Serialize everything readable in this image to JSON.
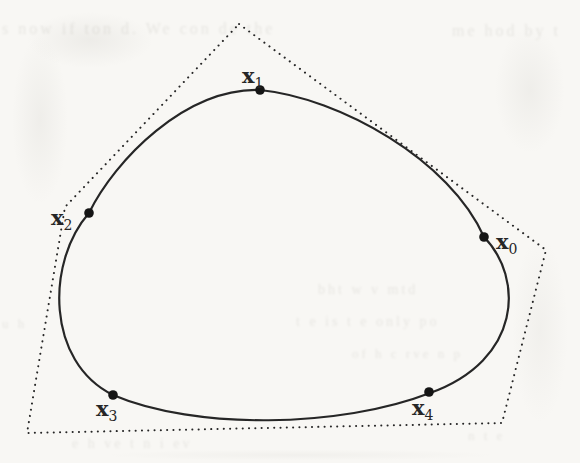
{
  "colors": {
    "paper": "#f8f7f4",
    "ink": "#262626",
    "dot": "#151515",
    "bleed": "#7d7a6f"
  },
  "figure": {
    "curve_path": "M 260 90 C 340 98 450 160 484 237 C 524 278 522 360 430 393 C 340 428 195 430 113 395 C 46 362 46 262 89 213 C 115 160 185 88 260 90 Z",
    "polygon_points": "239,24 546,250 502,423 27,433 65,207",
    "points": [
      {
        "id": "x0",
        "base": "x",
        "sub": "0",
        "dot": [
          484,
          237
        ],
        "label": [
          496,
          249
        ]
      },
      {
        "id": "x1",
        "base": "x",
        "sub": "1",
        "dot": [
          260,
          90
        ],
        "label": [
          242,
          83
        ]
      },
      {
        "id": "x2",
        "base": "x",
        "sub": "2",
        "dot": [
          89,
          213
        ],
        "label": [
          51,
          225
        ]
      },
      {
        "id": "x3",
        "base": "x",
        "sub": "3",
        "dot": [
          113,
          395
        ],
        "label": [
          96,
          416
        ]
      },
      {
        "id": "x4",
        "base": "x",
        "sub": "4",
        "dot": [
          429,
          392
        ],
        "label": [
          412,
          415
        ]
      }
    ]
  },
  "artifacts": [
    {
      "text": "s now if  ton d. We  con de  the",
      "x": 2,
      "y": 20,
      "size": 16
    },
    {
      "text": "me hod by t",
      "x": 452,
      "y": 22,
      "size": 16
    },
    {
      "text": "bht  w   v   mtd",
      "x": 318,
      "y": 282,
      "size": 14
    },
    {
      "text": "t e  is   t e  only  po",
      "x": 296,
      "y": 314,
      "size": 14
    },
    {
      "text": "of  h  c rve  n  p",
      "x": 352,
      "y": 346,
      "size": 13
    },
    {
      "text": "e  h ve   t   n i ev",
      "x": 72,
      "y": 436,
      "size": 14
    },
    {
      "text": "n  t   e",
      "x": 468,
      "y": 428,
      "size": 13
    },
    {
      "text": "u h",
      "x": 2,
      "y": 316,
      "size": 13
    }
  ]
}
